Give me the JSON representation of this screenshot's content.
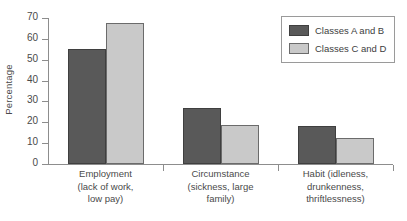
{
  "chart_data": {
    "type": "bar",
    "title": "",
    "xlabel": "",
    "ylabel": "Percentage",
    "ylim": [
      0,
      70
    ],
    "ytick_step": 10,
    "yticks": [
      70,
      60,
      50,
      40,
      30,
      20,
      10,
      0
    ],
    "grid": false,
    "legend_position": "top-right",
    "categories": [
      "Employment\n(lack of work,\nlow pay)",
      "Circumstance\n(sickness, large\nfamily)",
      "Habit (idleness,\ndrunkenness,\nthriftlessness)"
    ],
    "category_lines": [
      [
        "Employment",
        "(lack of work,",
        "low pay)"
      ],
      [
        "Circumstance",
        "(sickness, large",
        "family)"
      ],
      [
        "Habit (idleness,",
        "drunkenness,",
        "thriftlessness)"
      ]
    ],
    "series": [
      {
        "name": "Classes A and B",
        "color": "#595959",
        "values": [
          55,
          27,
          18
        ]
      },
      {
        "name": "Classes C and D",
        "color": "#c9c9c9",
        "values": [
          67.5,
          18.5,
          12.3
        ]
      }
    ]
  },
  "axis": {
    "ylabel": "Percentage",
    "ytick_labels": [
      "70",
      "60",
      "50",
      "40",
      "30",
      "20",
      "10",
      "0"
    ]
  },
  "legend": {
    "entries": [
      {
        "label": "Classes A and B",
        "swatch": "dark-gray-swatch"
      },
      {
        "label": "Classes C and D",
        "swatch": "light-gray-swatch"
      }
    ]
  }
}
